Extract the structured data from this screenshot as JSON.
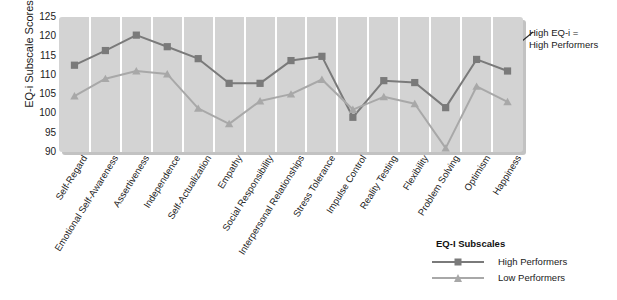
{
  "chart_data": {
    "type": "line",
    "title": "",
    "xlabel": "",
    "ylabel": "EQ-i Subscale Scores",
    "ylim": [
      90,
      125
    ],
    "yticks": [
      90,
      95,
      100,
      105,
      110,
      115,
      120,
      125
    ],
    "grid": "vertical-only",
    "legend_position": "bottom-right",
    "categories": [
      "Self-Regard",
      "Emotional Self-Awareness",
      "Assertiveness",
      "Independence",
      "Self-Actualization",
      "Empathy",
      "Social Responsibility",
      "Interpersonal Relationships",
      "Stress Tolerance",
      "Impulse Control",
      "Reality Testing",
      "Flexibility",
      "Problem Solving",
      "Optimism",
      "Happiness"
    ],
    "series": [
      {
        "name": "High Performers",
        "color": "#7a7a7a",
        "marker": "square",
        "values": [
          112.5,
          116.3,
          120.3,
          117.3,
          114.2,
          107.8,
          107.8,
          113.7,
          114.8,
          99.0,
          108.5,
          108.0,
          101.5,
          114.0,
          111.0
        ]
      },
      {
        "name": "Low Performers",
        "color": "#a8a8a8",
        "marker": "triangle",
        "values": [
          104.5,
          109.0,
          111.0,
          110.2,
          101.3,
          97.3,
          103.2,
          105.0,
          108.8,
          101.0,
          104.3,
          102.5,
          91.0,
          107.0,
          103.0
        ]
      }
    ],
    "annotations": [
      {
        "text_line_1": "High EQ-i =",
        "text_line_2": "High Performers",
        "points_at": "Optimism-Happiness segment"
      }
    ]
  },
  "legend": {
    "title": "EQ-I Subscales",
    "entries": [
      {
        "label": "High Performers",
        "color": "#7a7a7a",
        "marker": "square"
      },
      {
        "label": "Low Performers",
        "color": "#a8a8a8",
        "marker": "triangle"
      }
    ]
  },
  "colors": {
    "plot_background": "#d3d3d3",
    "gridline": "#ffffff",
    "page_background": "#ffffff",
    "high_performers": "#7a7a7a",
    "low_performers": "#a8a8a8",
    "text": "#1a1a1a"
  }
}
